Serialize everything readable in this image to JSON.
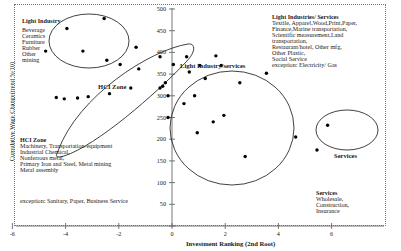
{
  "chart_data": {
    "type": "scatter",
    "title": "",
    "xlabel": "Investment Ranking (2nd Root)",
    "ylabel": "Cumulative Wage Change(trend %/10)",
    "xlim": [
      -6.6,
      7.0
    ],
    "ylim": [
      0,
      500
    ],
    "xticks": [
      "-6",
      "-4",
      "-2",
      "0",
      "2",
      "4",
      "6"
    ],
    "xtickvals": [
      -6,
      -4,
      -2,
      0,
      2,
      4,
      6
    ],
    "yticks": [
      "500",
      "450",
      "400",
      "350",
      "300",
      "250",
      "200",
      "150",
      "100",
      "50",
      "0"
    ],
    "ytickvals": [
      500,
      450,
      400,
      350,
      300,
      250,
      200,
      150,
      100,
      50,
      0
    ],
    "grid": false,
    "legend": "none",
    "marker": "filled-circle",
    "marker_color": "#000000",
    "series": [
      {
        "name": "Light Industry",
        "points": [
          {
            "x": -3.95,
            "y": 455
          },
          {
            "x": -2.55,
            "y": 478
          },
          {
            "x": -4.75,
            "y": 403
          },
          {
            "x": -3.35,
            "y": 403
          }
        ]
      },
      {
        "name": "HCI Zone",
        "points": [
          {
            "x": -1.35,
            "y": 412
          },
          {
            "x": -2.45,
            "y": 382
          },
          {
            "x": -0.45,
            "y": 390
          },
          {
            "x": -1.25,
            "y": 362
          },
          {
            "x": -1.95,
            "y": 372
          },
          {
            "x": -0.25,
            "y": 330
          },
          {
            "x": -0.35,
            "y": 322
          },
          {
            "x": -0.45,
            "y": 318
          },
          {
            "x": -1.55,
            "y": 318
          },
          {
            "x": -2.35,
            "y": 305
          },
          {
            "x": -3.15,
            "y": 298
          },
          {
            "x": -3.55,
            "y": 295
          },
          {
            "x": -4.05,
            "y": 293
          },
          {
            "x": -4.35,
            "y": 296
          },
          {
            "x": -0.15,
            "y": 300
          }
        ]
      },
      {
        "name": "Light Industry/Services",
        "points": [
          {
            "x": 0.55,
            "y": 390
          },
          {
            "x": 1.65,
            "y": 392
          },
          {
            "x": 0.05,
            "y": 372
          },
          {
            "x": 1.05,
            "y": 370
          },
          {
            "x": 1.85,
            "y": 370
          },
          {
            "x": 0.65,
            "y": 355
          },
          {
            "x": 1.25,
            "y": 340
          },
          {
            "x": 2.55,
            "y": 330
          },
          {
            "x": 0.85,
            "y": 300
          },
          {
            "x": 0.45,
            "y": 282
          },
          {
            "x": 1.95,
            "y": 255
          },
          {
            "x": 1.55,
            "y": 240
          },
          {
            "x": 0.95,
            "y": 215
          },
          {
            "x": -0.15,
            "y": 250
          },
          {
            "x": 3.55,
            "y": 352
          }
        ]
      },
      {
        "name": "Services",
        "points": [
          {
            "x": 5.85,
            "y": 232
          },
          {
            "x": 4.65,
            "y": 205
          },
          {
            "x": 5.45,
            "y": 175
          }
        ]
      },
      {
        "name": "other",
        "points": [
          {
            "x": 2.75,
            "y": 160
          }
        ]
      }
    ],
    "clusters": [
      {
        "name": "light-industry",
        "label": "Light Industry"
      },
      {
        "name": "hci-zone",
        "label": "HCI  Zone"
      },
      {
        "name": "light-industry-services",
        "label": "Light Industry/services"
      },
      {
        "name": "services",
        "label": "Services"
      }
    ]
  },
  "annotations": {
    "light_industry": {
      "title": "Light Industry",
      "lines": [
        "Beverage",
        "Ceramics",
        "Furniture",
        "Rubber",
        "Other",
        "mining"
      ]
    },
    "hci_zone": {
      "title": "HCI  Zone",
      "lines": [
        "Machinery, Transportation-equipment",
        "Industrial Chemical,",
        "Nonferrous metal,",
        "Primary  Iron and Steel, Metal mining",
        "Metal  assembly"
      ],
      "exception": "exception: Sanitary, Paper, Business  Service"
    },
    "light_industries_services": {
      "title": "Light Industries/ Services",
      "lines": [
        "Textile, Apparel,Wood,Print,Paper,",
        "Finance,Marine transportation,",
        "Scientific measurement,Land",
        "transportation,",
        "Restaurant/hotel, Other  mfg,",
        "Other  Plastic,",
        "Social Service"
      ],
      "exception": "exception: Electricity/ Gas"
    },
    "services": {
      "title": "Services",
      "lines": [
        "Wholesale,",
        "Construction,",
        "Insurance"
      ]
    }
  },
  "colors": {
    "marker": "#000000",
    "axis": "#555555",
    "frame": "#777777"
  }
}
